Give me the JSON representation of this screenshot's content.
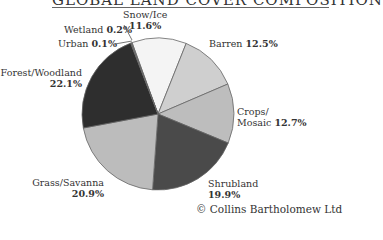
{
  "title": "GLOBAL LAND COVER COMPOSITION",
  "credit": "© Collins Bartholomew Ltd",
  "chart_data": {
    "type": "pie",
    "title": "GLOBAL LAND COVER COMPOSITION",
    "categories": [
      "Snow/Ice",
      "Barren",
      "Crops/Mosaic",
      "Shrubland",
      "Grass/Savanna",
      "Forest/Woodland",
      "Urban",
      "Wetland"
    ],
    "values": [
      11.6,
      12.5,
      12.7,
      19.9,
      20.9,
      22.1,
      0.1,
      0.2
    ],
    "colors": [
      "#f4f4f4",
      "#cfcfcf",
      "#bdbdbd",
      "#4a4a4a",
      "#bcbcbc",
      "#2e2e2e",
      "#888888",
      "#888888"
    ],
    "legend_position": "labels around pie"
  },
  "labels": {
    "snow_name": "Snow/Ice",
    "snow_val": "11.6%",
    "barren_name": "Barren",
    "barren_val": "12.5%",
    "crops_name1": "Crops/",
    "crops_name2": "Mosaic",
    "crops_val": "12.7%",
    "shrub_name": "Shrubland",
    "shrub_val": "19.9%",
    "grass_name": "Grass/Savanna",
    "grass_val": "20.9%",
    "forest_name": "Forest/Woodland",
    "forest_val": "22.1%",
    "urban_name": "Urban",
    "urban_val": "0.1%",
    "wetland_name": "Wetland",
    "wetland_val": "0.2%"
  }
}
